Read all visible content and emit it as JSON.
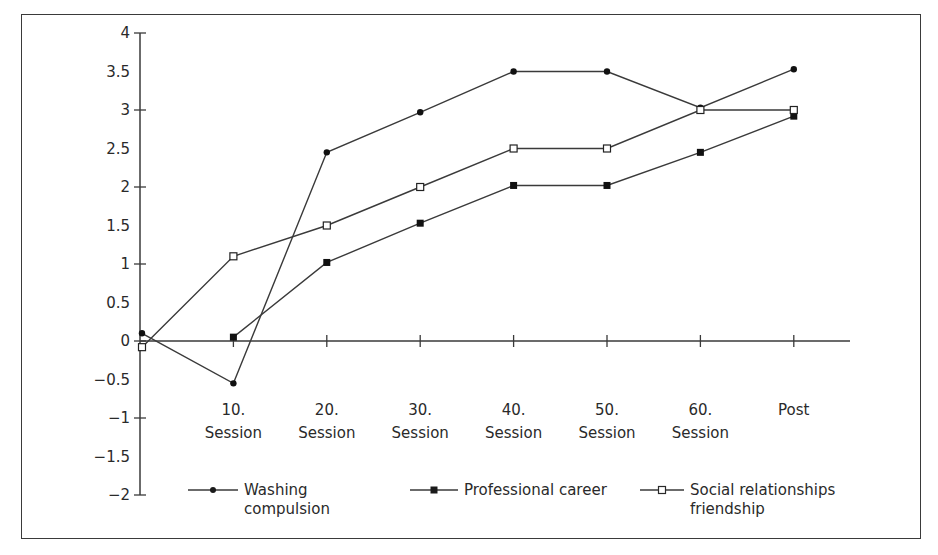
{
  "chart_data": {
    "type": "line",
    "title": "",
    "xlabel": "",
    "ylabel": "",
    "categories": [
      "Pre",
      "10. Session",
      "20. Session",
      "30. Session",
      "40. Session",
      "50. Session",
      "60. Session",
      "Post"
    ],
    "x_tick_labels": [
      {
        "line1": "10.",
        "line2": "Session"
      },
      {
        "line1": "20.",
        "line2": "Session"
      },
      {
        "line1": "30.",
        "line2": "Session"
      },
      {
        "line1": "40.",
        "line2": "Session"
      },
      {
        "line1": "50.",
        "line2": "Session"
      },
      {
        "line1": "60.",
        "line2": "Session"
      },
      {
        "line1": "Post",
        "line2": ""
      }
    ],
    "y_ticks": [
      4,
      3.5,
      3,
      2.5,
      2,
      1.5,
      1,
      0.5,
      0,
      -0.5,
      -1,
      -1.5,
      -2
    ],
    "y_tick_labels": [
      "4",
      "3.5",
      "3",
      "2.5",
      "2",
      "1.5",
      "1",
      "0.5",
      "0",
      "−0.5",
      "−1",
      "−1.5",
      "−2"
    ],
    "ylim": [
      -2,
      4
    ],
    "grid": false,
    "legend_position": "bottom",
    "series": [
      {
        "name": "Washing compulsion",
        "legend_line1": "Washing",
        "legend_line2": "compulsion",
        "marker": "filled-circle",
        "values": [
          0.1,
          -0.55,
          2.45,
          2.97,
          3.5,
          3.5,
          3.03,
          3.53
        ]
      },
      {
        "name": "Professional career",
        "legend_line1": "Professional career",
        "legend_line2": "",
        "marker": "filled-square",
        "values": [
          null,
          0.05,
          1.02,
          1.53,
          2.02,
          2.02,
          2.45,
          2.92
        ]
      },
      {
        "name": "Social relationships friendship",
        "legend_line1": "Social relationships",
        "legend_line2": "friendship",
        "marker": "open-square",
        "values": [
          -0.08,
          1.1,
          1.5,
          2.0,
          2.5,
          2.5,
          3.0,
          3.0
        ]
      }
    ]
  },
  "legend": {
    "items": [
      {
        "line1": "Washing",
        "line2": "compulsion"
      },
      {
        "line1": "Professional career",
        "line2": ""
      },
      {
        "line1": "Social relationships",
        "line2": "friendship"
      }
    ]
  },
  "colors": {
    "line": "#3a3a3a",
    "text": "#2a2a2a",
    "background": "#ffffff"
  }
}
